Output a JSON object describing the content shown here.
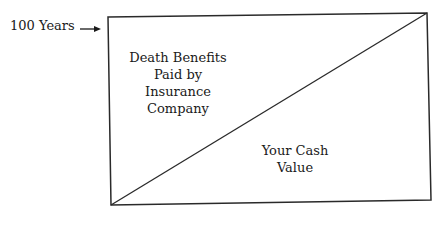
{
  "diagram": {
    "axis_marker": {
      "label": "100 Years",
      "arrow": "right-arrow"
    },
    "regions": [
      {
        "name": "upper-left-triangle",
        "lines": [
          "Death Benefits",
          "Paid by",
          "Insurance",
          "Company"
        ]
      },
      {
        "name": "lower-right-triangle",
        "lines": [
          "Your Cash",
          "Value"
        ]
      }
    ],
    "colors": {
      "stroke": "#2a2a2a",
      "text": "#1a1a1a",
      "background": "#ffffff"
    }
  }
}
